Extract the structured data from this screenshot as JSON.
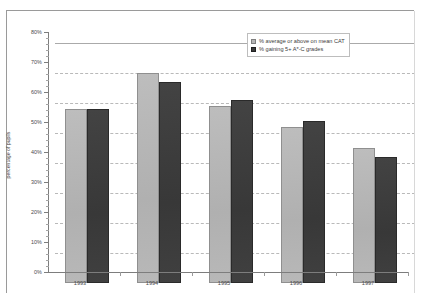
{
  "chart_data": {
    "type": "bar",
    "title": "",
    "xlabel": "",
    "ylabel": "percentage of pupils",
    "categories": [
      "1993",
      "1994",
      "1995",
      "1996",
      "1997"
    ],
    "series": [
      {
        "name": "% average or above on mean CAT",
        "values": [
          58,
          70,
          59,
          52,
          45
        ],
        "color": "#b6b6b6"
      },
      {
        "name": "% gaining 5+ A*-C grades",
        "values": [
          58,
          67,
          61,
          54,
          42
        ],
        "color": "#3b3b3b"
      }
    ],
    "ylim": [
      0,
      80
    ],
    "ytick_labels": [
      "80%",
      "70%",
      "60%",
      "50%",
      "40%",
      "30%",
      "20%",
      "10%",
      "0%"
    ],
    "ytick_values": [
      80,
      70,
      60,
      50,
      40,
      30,
      20,
      10,
      0
    ],
    "grid": true,
    "legend_position": "top-right"
  },
  "legend": {
    "items": [
      {
        "label": "% average or above on mean CAT",
        "swatch": "light"
      },
      {
        "label": "% gaining 5+ A*-C grades",
        "swatch": "dark"
      }
    ]
  }
}
